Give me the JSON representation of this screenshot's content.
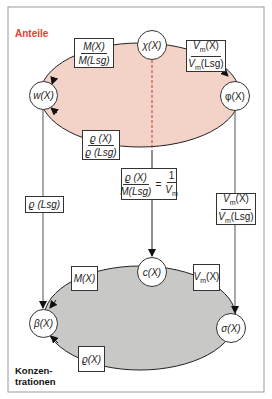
{
  "colors": {
    "frame": "#9a9a9a",
    "top_ellipse_fill": "#f3d2c8",
    "bottom_ellipse_fill": "#c8c9c6",
    "title_top": "#e0432f",
    "lines": "#222222"
  },
  "titles": {
    "top": "Anteile",
    "bottom_line1": "Konzen-",
    "bottom_line2": "trationen"
  },
  "nodes": {
    "chi": "χ(X)",
    "w": "w(X)",
    "phi": "φ(X)",
    "c": "c(X)",
    "beta": "β(X)",
    "sigma": "σ(X)"
  },
  "boxes": {
    "top_left": {
      "num": "M(X)",
      "den": "M(Lsg)"
    },
    "top_right": {
      "num_sym": "V",
      "num_sub": "m",
      "num_arg": "(X)",
      "den_sym": "V",
      "den_sub": "m",
      "den_arg": "(Lsg)"
    },
    "top_bottom": {
      "num": "ϱ (X)",
      "den": "ϱ (Lsg)"
    },
    "center": {
      "num": "ϱ (X)",
      "den": "M(Lsg)",
      "eq": "=",
      "rhs_num": "1",
      "rhs_den_sym": "V",
      "rhs_den_sub": "m"
    },
    "left_vertical": {
      "text": "ϱ (Lsg)"
    },
    "right_vertical": {
      "num_sym": "V",
      "num_sub": "m",
      "num_arg": "(X)",
      "den_sym": "V",
      "den_sub": "m",
      "den_arg": "(Lsg)"
    },
    "bottom_left": {
      "text": "M(X)"
    },
    "bottom_right": {
      "sym": "V",
      "sub": "m",
      "arg": "(X)"
    },
    "bottom_bottom": {
      "text": "ϱ(X)"
    }
  }
}
